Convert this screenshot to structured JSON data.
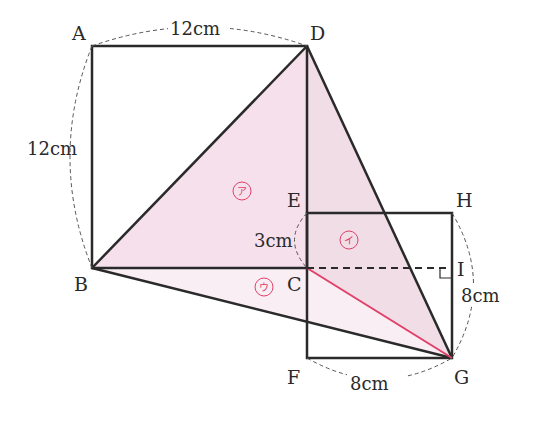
{
  "diagram": {
    "points": {
      "A": {
        "label": "A"
      },
      "B": {
        "label": "B"
      },
      "C": {
        "label": "C"
      },
      "D": {
        "label": "D"
      },
      "E": {
        "label": "E"
      },
      "F": {
        "label": "F"
      },
      "G": {
        "label": "G"
      },
      "H": {
        "label": "H"
      },
      "I": {
        "label": "I"
      }
    },
    "dimensions": {
      "AD": "12cm",
      "AB": "12cm",
      "EC": "3cm",
      "IG": "8cm",
      "FG": "8cm"
    },
    "regions": {
      "a": "ア",
      "i": "イ",
      "u": "ウ"
    },
    "colors": {
      "line": "#2a2a2a",
      "region_fill": "#f4dbe8",
      "region_fill_light": "#f8edf3",
      "accent_red": "#e0406a"
    }
  }
}
